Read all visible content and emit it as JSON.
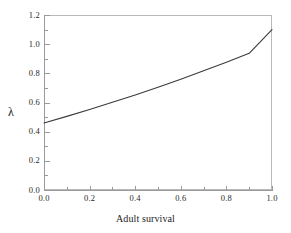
{
  "chart_data": {
    "type": "line",
    "title": "",
    "subtitle": "",
    "xlabel": "Adult survival",
    "ylabel": "λ",
    "xlim": [
      0.0,
      1.0
    ],
    "ylim": [
      0.0,
      1.2
    ],
    "grid": false,
    "legend": null,
    "x_ticks": [
      "0.0",
      "0.2",
      "0.4",
      "0.6",
      "0.8",
      "1.0"
    ],
    "x_tick_values": [
      0.0,
      0.2,
      0.4,
      0.6,
      0.8,
      1.0
    ],
    "x_minor_ticks": [
      0.1,
      0.3,
      0.5,
      0.7,
      0.9
    ],
    "y_ticks": [
      "0.0",
      "0.2",
      "0.4",
      "0.6",
      "0.8",
      "1.0",
      "1.2"
    ],
    "y_tick_values": [
      0.0,
      0.2,
      0.4,
      0.6,
      0.8,
      1.0,
      1.2
    ],
    "y_minor_ticks": [
      0.1,
      0.3,
      0.5,
      0.7,
      0.9,
      1.1
    ],
    "series": [
      {
        "name": "lambda",
        "color": "#3a3a3a",
        "x": [
          0.0,
          0.1,
          0.2,
          0.3,
          0.4,
          0.5,
          0.6,
          0.7,
          0.8,
          0.9,
          1.0
        ],
        "values": [
          0.46,
          0.505,
          0.552,
          0.601,
          0.652,
          0.705,
          0.76,
          0.817,
          0.876,
          0.937,
          1.1
        ]
      }
    ],
    "annotations": []
  },
  "axes": {
    "y_title": "λ",
    "x_title": "Adult survival"
  },
  "colors": {
    "frame": "#b9b9b9",
    "axis": "#9a9a9a",
    "curve": "#3a3a3a",
    "background": "#ffffff",
    "text": "#222222"
  }
}
